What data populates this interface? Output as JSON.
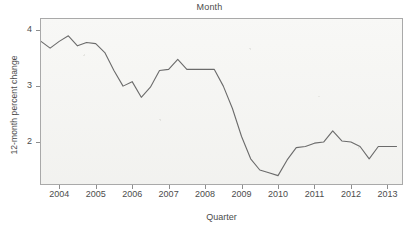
{
  "chart_data": {
    "type": "line",
    "title": "Month",
    "xlabel": "Quarter",
    "ylabel": "12-month percent change",
    "grid": false,
    "legend": "none",
    "xlim": [
      2003.5,
      2013.4
    ],
    "ylim": [
      1.25,
      4.2
    ],
    "xticks": [
      "2004",
      "2005",
      "2006",
      "2007",
      "2008",
      "2009",
      "2010",
      "2011",
      "2012",
      "2013"
    ],
    "xtick_values": [
      2004,
      2005,
      2006,
      2007,
      2008,
      2009,
      2010,
      2011,
      2012,
      2013
    ],
    "yticks": [
      "2",
      "3",
      "4"
    ],
    "ytick_values": [
      2,
      3,
      4
    ],
    "line_color": "#6b6b6b",
    "plot_background": "#f4f4f2",
    "frame_color": "#a9a9a9",
    "text_color": "#4c4c4c",
    "series": [
      {
        "name": "12-month percent change",
        "x": [
          2003.5,
          2003.75,
          2004.0,
          2004.25,
          2004.5,
          2004.75,
          2005.0,
          2005.25,
          2005.5,
          2005.75,
          2006.0,
          2006.25,
          2006.5,
          2006.75,
          2007.0,
          2007.25,
          2007.5,
          2007.75,
          2008.0,
          2008.25,
          2008.5,
          2008.75,
          2009.0,
          2009.25,
          2009.5,
          2009.75,
          2010.0,
          2010.25,
          2010.5,
          2010.75,
          2011.0,
          2011.25,
          2011.5,
          2011.75,
          2012.0,
          2012.25,
          2012.5,
          2012.75,
          2013.0,
          2013.25
        ],
        "values": [
          3.8,
          3.68,
          3.8,
          3.9,
          3.72,
          3.78,
          3.76,
          3.6,
          3.28,
          3.0,
          3.08,
          2.8,
          2.98,
          3.28,
          3.3,
          3.48,
          3.3,
          3.3,
          3.3,
          3.3,
          3.0,
          2.6,
          2.1,
          1.7,
          1.5,
          1.45,
          1.4,
          1.68,
          1.9,
          1.92,
          1.98,
          2.0,
          2.2,
          2.02,
          2.0,
          1.92,
          1.7,
          1.92,
          1.92,
          1.92
        ]
      }
    ]
  }
}
